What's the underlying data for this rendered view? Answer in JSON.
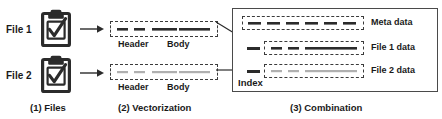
{
  "diagram": {
    "colors": {
      "ink": "#2b2b2b",
      "dark_dash": "#3b3b3b",
      "light_dash": "#b8b8b8",
      "box_border": "#4a4a4a",
      "background": "#ffffff"
    },
    "stages": [
      {
        "id": "files",
        "caption": "(1) Files",
        "items": [
          {
            "label": "File 1",
            "icon": "clipboard-checklist-icon"
          },
          {
            "label": "File 2",
            "icon": "clipboard-checklist-icon"
          }
        ]
      },
      {
        "id": "vectorization",
        "caption": "(2) Vectorization",
        "rows": [
          {
            "header_label": "Header",
            "body_label": "Body",
            "tone": "dark"
          },
          {
            "header_label": "Header",
            "body_label": "Body",
            "tone": "light"
          }
        ]
      },
      {
        "id": "combination",
        "caption": "(3) Combination",
        "index_label": "Index",
        "rows": [
          {
            "label": "Meta data",
            "tone": "dark",
            "has_stub": false
          },
          {
            "label": "File 1 data",
            "tone": "dark",
            "has_stub": true
          },
          {
            "label": "File 2 data",
            "tone": "light",
            "has_stub": true
          }
        ]
      }
    ],
    "arrows": [
      {
        "name": "file1-to-vector1",
        "kind": "horizontal"
      },
      {
        "name": "file2-to-vector2",
        "kind": "horizontal"
      },
      {
        "name": "vector1-to-combination",
        "kind": "diagonal"
      },
      {
        "name": "vector2-to-combination",
        "kind": "horizontal"
      }
    ]
  }
}
